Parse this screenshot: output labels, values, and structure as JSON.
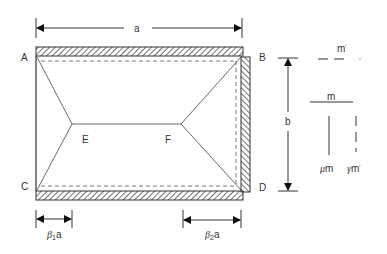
{
  "diagram": {
    "dimension_a": "a",
    "dimension_b": "b",
    "corners": {
      "A": "A",
      "B": "B",
      "C": "C",
      "D": "D"
    },
    "nodes": {
      "E": "E",
      "F": "F"
    },
    "beta1_sym": "β",
    "beta1_sub": "1",
    "beta1_suffix": "a",
    "beta2_sym": "β",
    "beta2_sub": "2",
    "beta2_suffix": "a",
    "legend": {
      "neg_top": "m",
      "neg_top_mark": "'",
      "pos_top": "m",
      "mu_sym": "μ",
      "mu_suffix": "m",
      "gamma_sym": "γ",
      "gamma_suffix": "m",
      "gamma_mark": "'"
    }
  }
}
